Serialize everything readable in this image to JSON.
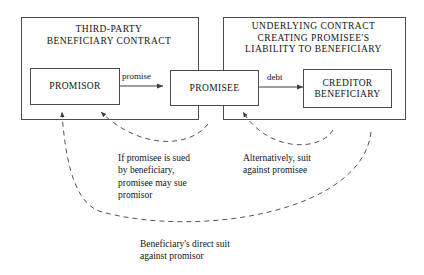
{
  "diagram": {
    "title_semantic": "third-party-beneficiary-contract-diagram",
    "containers": [
      {
        "id": "third-party",
        "title_lines": [
          "THIRD-PARTY",
          "BENEFICIARY CONTRACT"
        ]
      },
      {
        "id": "underlying",
        "title_lines": [
          "UNDERLYING CONTRACT",
          "CREATING PROMISEE'S",
          "LIABILITY TO BENEFICIARY"
        ]
      }
    ],
    "nodes": [
      {
        "id": "promisor",
        "lines": [
          "PROMISOR"
        ]
      },
      {
        "id": "promisee",
        "lines": [
          "PROMISEE"
        ]
      },
      {
        "id": "creditor-beneficiary",
        "lines": [
          "CREDITOR",
          "BENEFICIARY"
        ]
      }
    ],
    "edges": [
      {
        "id": "promise",
        "label": "promise",
        "from": "promisor",
        "to": "promisee",
        "style": "solid"
      },
      {
        "id": "debt",
        "label": "debt",
        "from": "promisee",
        "to": "creditor-beneficiary",
        "style": "solid"
      }
    ],
    "captions": [
      {
        "id": "promisee-sued",
        "lines": [
          "If promisee is sued",
          "by beneficiary,",
          "promisee may sue",
          "promisor"
        ]
      },
      {
        "id": "alternative-suit",
        "lines": [
          "Alternatively, suit",
          "against promisee"
        ]
      },
      {
        "id": "direct-suit",
        "lines": [
          "Beneficiary's direct suit",
          "against promisor"
        ]
      }
    ],
    "colors": {
      "stroke": "#4d4d4d",
      "text": "#141414",
      "background": "#ffffff"
    }
  }
}
